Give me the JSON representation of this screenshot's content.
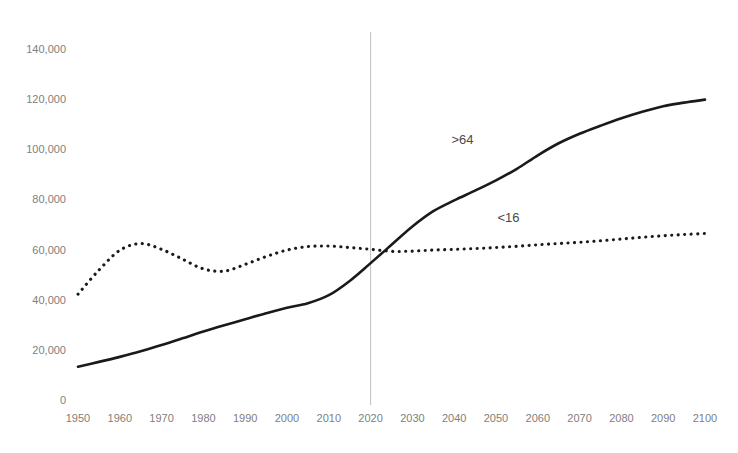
{
  "chart_data": {
    "type": "line",
    "title": "",
    "subtitle": "",
    "xlabel": "",
    "ylabel": "",
    "xlim": [
      1950,
      2100
    ],
    "ylim": [
      0,
      140000
    ],
    "grid": false,
    "legend_position": "inline-annotation",
    "x_ticks": [
      1950,
      1960,
      1970,
      1980,
      1990,
      2000,
      2010,
      2020,
      2030,
      2040,
      2050,
      2060,
      2070,
      2080,
      2090,
      2100
    ],
    "x_tick_labels": [
      "1950",
      "1960",
      "1970",
      "1980",
      "1990",
      "2000",
      "2010",
      "2020",
      "2030",
      "2040",
      "2050",
      "2060",
      "2070",
      "2080",
      "2090",
      "2100"
    ],
    "y_ticks": [
      0,
      20000,
      40000,
      60000,
      80000,
      100000,
      120000,
      140000
    ],
    "y_tick_labels": [
      "0",
      "20,000",
      "40,000",
      "60,000",
      "80,000",
      "100,000",
      "120,000",
      "140,000"
    ],
    "annotations": [
      {
        "text": ">64",
        "x": 2042,
        "y": 102000,
        "series": "over-64"
      },
      {
        "text": "<16",
        "x": 2053,
        "y": 71000,
        "series": "under-16"
      }
    ],
    "markers": [
      {
        "type": "vline",
        "x": 2020,
        "label": "",
        "color": "#bfbfbf"
      }
    ],
    "x": [
      1950,
      1955,
      1960,
      1965,
      1970,
      1975,
      1980,
      1985,
      1990,
      1995,
      2000,
      2005,
      2010,
      2015,
      2020,
      2025,
      2030,
      2035,
      2040,
      2045,
      2050,
      2055,
      2060,
      2065,
      2070,
      2075,
      2080,
      2085,
      2090,
      2095,
      2100
    ],
    "series": [
      {
        "name": "over-64",
        "label": ">64",
        "style": "solid",
        "color": "#1a1a1a",
        "values": [
          13300,
          15200,
          17200,
          19400,
          21900,
          24600,
          27300,
          29800,
          32200,
          34600,
          36800,
          38600,
          41800,
          47500,
          54600,
          61900,
          69200,
          75300,
          79600,
          83500,
          87600,
          92200,
          97600,
          102400,
          106200,
          109400,
          112400,
          115000,
          117200,
          118600,
          119800
        ]
      },
      {
        "name": "under-16",
        "label": "<16",
        "style": "dotted",
        "color": "#1a1a1a",
        "values": [
          42200,
          51800,
          59700,
          62400,
          60100,
          56200,
          52300,
          51400,
          54100,
          57200,
          59800,
          61200,
          61400,
          60800,
          60100,
          59300,
          59400,
          59800,
          60100,
          60400,
          60800,
          61300,
          61900,
          62400,
          62900,
          63500,
          64200,
          64900,
          65500,
          66000,
          66400
        ]
      }
    ]
  },
  "plot_geometry": {
    "left": 78,
    "right": 705,
    "top": 49,
    "bottom": 400
  }
}
